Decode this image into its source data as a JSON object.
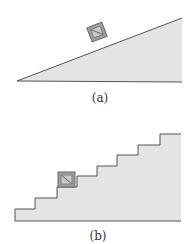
{
  "figure": {
    "panels": [
      {
        "id": "a",
        "label": "(a)",
        "description": "block on inclined plane (ramp)"
      },
      {
        "id": "b",
        "label": "(b)",
        "description": "block on staircase"
      }
    ],
    "colors": {
      "fill": "#e4e4e4",
      "stroke": "#555555",
      "box_fill": "#a0a0a0",
      "box_inner": "#c8c8c8"
    }
  }
}
